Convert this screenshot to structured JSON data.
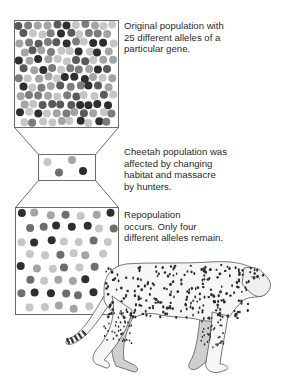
{
  "captions": {
    "original": "Original population with\n25 different alleles of a\nparticular gene.",
    "bottleneck": "Cheetah population was\naffected by changing\nhabitat and massacre\nby hunters.",
    "repopulation": "Repopulation\noccurs. Only four\ndifferent alleles remain."
  },
  "colors": {
    "outline": "#6a6a6a",
    "allele_shades": [
      "#2e2e2e",
      "#5a5a5a",
      "#7c7c7c",
      "#a4a4a4",
      "#c6c6c6"
    ]
  },
  "stages": [
    {
      "name": "original-population",
      "allele_count": 25
    },
    {
      "name": "bottleneck-population",
      "allele_count": 4
    },
    {
      "name": "repopulated-population",
      "allele_count": 4
    }
  ]
}
